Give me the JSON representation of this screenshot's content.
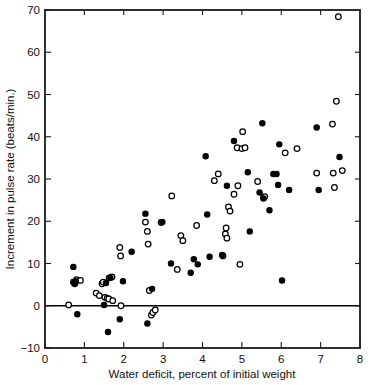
{
  "chart_data": {
    "type": "scatter",
    "title": "",
    "xlabel": "Water deficit, percent of initial weight",
    "ylabel": "Increment in pulse rate (beats/min.)",
    "xlim": [
      0,
      8
    ],
    "ylim": [
      -10,
      70
    ],
    "xticks": [
      0,
      1,
      2,
      3,
      4,
      5,
      6,
      7,
      8
    ],
    "yticks": [
      -10,
      0,
      10,
      20,
      30,
      40,
      50,
      60,
      70
    ],
    "xticklabels": [
      "0",
      "1",
      "2",
      "3",
      "4",
      "5",
      "6",
      "7",
      "8"
    ],
    "yticklabels": [
      "−10",
      "0",
      "10",
      "20",
      "30",
      "40",
      "50",
      "60",
      "70"
    ],
    "grid": false,
    "legend": null,
    "annotations": [
      {
        "kind": "reference-line",
        "axis": "y",
        "value": 0,
        "label": "zero increment line"
      }
    ],
    "series": [
      {
        "name": "open-circle observations",
        "marker": "open-circle",
        "color": "#ffffff",
        "edge_color": "#000000",
        "points": [
          [
            0.6,
            0.2
          ],
          [
            0.72,
            5.6
          ],
          [
            0.76,
            5.2
          ],
          [
            0.8,
            6.2
          ],
          [
            0.9,
            6.0
          ],
          [
            1.3,
            3.0
          ],
          [
            1.38,
            2.4
          ],
          [
            1.45,
            5.2
          ],
          [
            1.48,
            5.6
          ],
          [
            1.52,
            2.0
          ],
          [
            1.58,
            1.8
          ],
          [
            1.62,
            1.6
          ],
          [
            1.63,
            6.6
          ],
          [
            1.7,
            6.8
          ],
          [
            1.72,
            1.2
          ],
          [
            1.9,
            13.8
          ],
          [
            1.92,
            11.8
          ],
          [
            1.93,
            0.0
          ],
          [
            2.55,
            19.8
          ],
          [
            2.6,
            17.6
          ],
          [
            2.62,
            14.6
          ],
          [
            2.65,
            3.6
          ],
          [
            2.7,
            -2.2
          ],
          [
            2.74,
            -1.6
          ],
          [
            2.8,
            -1.0
          ],
          [
            2.95,
            19.7
          ],
          [
            3.22,
            26.0
          ],
          [
            3.36,
            8.6
          ],
          [
            3.45,
            16.6
          ],
          [
            3.5,
            15.4
          ],
          [
            3.85,
            19.0
          ],
          [
            4.3,
            29.6
          ],
          [
            4.4,
            31.2
          ],
          [
            4.52,
            11.8
          ],
          [
            4.58,
            17.0
          ],
          [
            4.6,
            18.4
          ],
          [
            4.62,
            16.0
          ],
          [
            4.66,
            23.4
          ],
          [
            4.7,
            22.4
          ],
          [
            4.8,
            26.4
          ],
          [
            4.88,
            37.4
          ],
          [
            4.9,
            28.4
          ],
          [
            4.95,
            9.8
          ],
          [
            5.0,
            37.2
          ],
          [
            5.02,
            41.2
          ],
          [
            5.08,
            37.4
          ],
          [
            5.4,
            29.4
          ],
          [
            5.55,
            25.6
          ],
          [
            5.58,
            25.8
          ],
          [
            6.1,
            36.2
          ],
          [
            6.4,
            37.2
          ],
          [
            6.9,
            31.4
          ],
          [
            7.3,
            43.0
          ],
          [
            7.32,
            31.4
          ],
          [
            7.35,
            28.0
          ],
          [
            7.4,
            48.4
          ],
          [
            7.45,
            68.4
          ],
          [
            7.55,
            32.0
          ]
        ]
      },
      {
        "name": "filled-circle observations",
        "marker": "filled-circle",
        "color": "#000000",
        "edge_color": "#000000",
        "points": [
          [
            0.72,
            9.2
          ],
          [
            0.74,
            5.4
          ],
          [
            0.78,
            5.8
          ],
          [
            0.82,
            -2.0
          ],
          [
            1.5,
            0.2
          ],
          [
            1.55,
            5.4
          ],
          [
            1.6,
            -6.2
          ],
          [
            1.66,
            6.6
          ],
          [
            1.9,
            -3.2
          ],
          [
            1.98,
            5.8
          ],
          [
            2.2,
            12.8
          ],
          [
            2.55,
            21.8
          ],
          [
            2.6,
            -4.2
          ],
          [
            2.72,
            4.0
          ],
          [
            2.98,
            19.8
          ],
          [
            3.2,
            10.0
          ],
          [
            3.7,
            7.8
          ],
          [
            3.78,
            11.0
          ],
          [
            3.88,
            9.8
          ],
          [
            4.08,
            35.4
          ],
          [
            4.12,
            21.6
          ],
          [
            4.18,
            11.6
          ],
          [
            4.5,
            12.0
          ],
          [
            4.62,
            28.4
          ],
          [
            4.8,
            39.0
          ],
          [
            5.15,
            31.6
          ],
          [
            5.2,
            17.6
          ],
          [
            5.45,
            26.8
          ],
          [
            5.52,
            43.2
          ],
          [
            5.55,
            25.4
          ],
          [
            5.8,
            31.2
          ],
          [
            5.88,
            31.2
          ],
          [
            5.92,
            28.6
          ],
          [
            5.95,
            38.2
          ],
          [
            6.02,
            6.0
          ],
          [
            5.7,
            22.6
          ],
          [
            6.2,
            27.4
          ],
          [
            6.9,
            42.2
          ],
          [
            6.95,
            27.4
          ],
          [
            7.48,
            35.2
          ]
        ]
      }
    ]
  },
  "axes": {
    "x_title": "Water deficit, percent of initial weight",
    "y_title": "Increment in pulse rate (beats/min.)"
  }
}
